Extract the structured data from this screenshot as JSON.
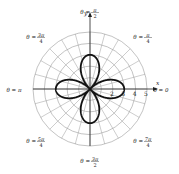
{
  "chart_data": {
    "type": "line",
    "subtype": "polar",
    "title": "",
    "curve": {
      "description": "four-petal rose, petals aligned with the axes (theta = 0, pi/2, pi, 3pi/2)",
      "amplitude": 3,
      "petals": 4,
      "petal_directions": [
        "0",
        "π/2",
        "π",
        "3π/2"
      ]
    },
    "radial_ticks": [
      1,
      2,
      3,
      4,
      5
    ],
    "radial_tick_labels_shown": [
      "2",
      "3",
      "4",
      "5"
    ],
    "rmax": 5,
    "angular_gridline_step_deg": 15,
    "axis_labels": {
      "x": "x",
      "y": "y"
    },
    "angle_labels": [
      {
        "angle_deg": 0,
        "num": "0",
        "den": "",
        "text": "θ = 0"
      },
      {
        "angle_deg": 45,
        "num": "π",
        "den": "4",
        "text": "θ = π/4"
      },
      {
        "angle_deg": 90,
        "num": "π",
        "den": "2",
        "text": "θ = π/2"
      },
      {
        "angle_deg": 135,
        "num": "3π",
        "den": "4",
        "text": "θ = 3π/4"
      },
      {
        "angle_deg": 180,
        "num": "π",
        "den": "",
        "text": "θ = π"
      },
      {
        "angle_deg": 225,
        "num": "5π",
        "den": "4",
        "text": "θ = 5π/4"
      },
      {
        "angle_deg": 270,
        "num": "3π",
        "den": "2",
        "text": "θ = 3π/2"
      },
      {
        "angle_deg": 315,
        "num": "7π",
        "den": "4",
        "text": "θ = 7π/4"
      }
    ],
    "grid": true,
    "colors": {
      "grid": "#9a9a9a",
      "curve": "#111111",
      "axis": "#222222"
    }
  }
}
